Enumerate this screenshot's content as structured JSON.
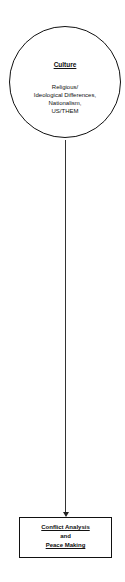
{
  "diagram": {
    "source_node": {
      "shape": "circle",
      "title": "Culture",
      "body_lines": [
        "Religious/",
        "Ideological Differences,",
        "Nationalism,",
        "US/THEM"
      ]
    },
    "target_node": {
      "shape": "rectangle",
      "lines": [
        "Conflict Analysis",
        "and",
        "Peace Making"
      ]
    },
    "edge": {
      "from": "Culture",
      "to": "Conflict Analysis and Peace Making",
      "style": "arrow"
    },
    "colors": {
      "stroke": "#111111",
      "background": "#ffffff"
    }
  }
}
